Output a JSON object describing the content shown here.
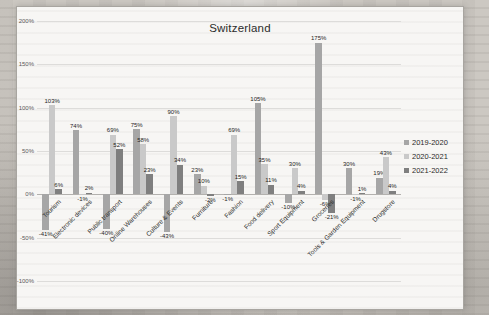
{
  "title": "Switzerland",
  "chart_data": {
    "type": "bar",
    "title": "Switzerland",
    "categories": [
      "Tourism",
      "Electronic devices",
      "Public transport",
      "Online Warehouses",
      "Culture & Events",
      "Furniture",
      "Fashion",
      "Food delivery",
      "Sport Equipment",
      "Groceries",
      "Tools & Garden Equipment",
      "Drugstore"
    ],
    "series": [
      {
        "name": "2019-2020",
        "color": "#a6a6a6",
        "values": [
          -41,
          74,
          -40,
          75,
          -43,
          23,
          -1,
          105,
          -10,
          175,
          30,
          19
        ]
      },
      {
        "name": "2020-2021",
        "color": "#c9c9c9",
        "values": [
          103,
          -1,
          69,
          58,
          90,
          10,
          69,
          35,
          30,
          -6,
          -1,
          43
        ]
      },
      {
        "name": "2021-2022",
        "color": "#7f7f7f",
        "values": [
          6,
          2,
          52,
          23,
          34,
          -2,
          15,
          11,
          4,
          -21,
          1,
          4
        ]
      }
    ],
    "ylim": [
      -100,
      200
    ],
    "ytick_labels": [
      "200%",
      "150%",
      "100%",
      "50%",
      "0%",
      "-50%",
      "-100%"
    ],
    "ytick_values": [
      200,
      150,
      100,
      50,
      0,
      -50,
      -100
    ],
    "grid": true,
    "data_labels": true,
    "data_label_suffix": "%",
    "legend_position": "right"
  }
}
